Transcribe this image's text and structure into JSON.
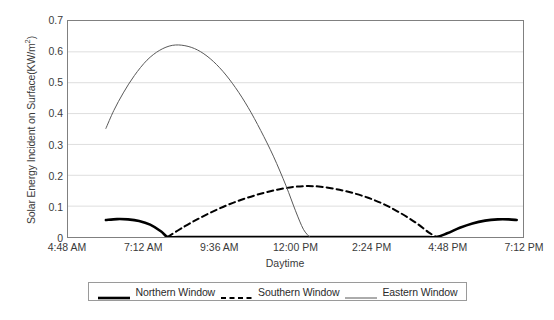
{
  "chart_data": {
    "type": "line",
    "title": "",
    "xlabel": "Daytime",
    "ylabel": "Solar Energy Incident on Surface(KW/m",
    "ylabel_sup": "2",
    "ylabel_suffix": ")",
    "xtick_labels": [
      "4:48 AM",
      "7:12 AM",
      "9:36 AM",
      "12:00 PM",
      "2:24 PM",
      "4:48 PM",
      "7:12 PM"
    ],
    "ytick_labels": [
      "0.7",
      "0.6",
      "0.5",
      "0.4",
      "0.3",
      "0.2",
      "0.1",
      "0"
    ],
    "ytick_values": [
      0.7,
      0.6,
      0.5,
      0.4,
      0.3,
      0.2,
      0.1,
      0
    ],
    "ylim": [
      0,
      0.7
    ],
    "xlim_hours": [
      4.8,
      19.2
    ],
    "grid": "horizontal",
    "legend_position": "bottom",
    "series": [
      {
        "name": "Northern Window",
        "style": "solid-thick",
        "color": "#000000",
        "width": 2.6,
        "x_hours": [
          6.0,
          6.35,
          6.7,
          7.05,
          7.4,
          7.75,
          7.95,
          8.3,
          9.0,
          10.0,
          11.0,
          12.0,
          13.0,
          14.0,
          15.0,
          16.0,
          16.45,
          16.8,
          17.2,
          17.6,
          18.0,
          18.4,
          18.75,
          19.0
        ],
        "y_values": [
          0.055,
          0.058,
          0.057,
          0.052,
          0.04,
          0.018,
          0.0,
          0.0,
          0.0,
          0.0,
          0.0,
          0.0,
          0.0,
          0.0,
          0.0,
          0.0,
          0.0,
          0.012,
          0.03,
          0.044,
          0.053,
          0.057,
          0.057,
          0.055
        ]
      },
      {
        "name": "Southern Window",
        "style": "dashed",
        "color": "#000000",
        "width": 2.0,
        "x_hours": [
          7.95,
          8.5,
          9.0,
          9.5,
          10.0,
          10.5,
          11.0,
          11.5,
          12.0,
          12.4,
          12.8,
          13.3,
          13.8,
          14.3,
          14.8,
          15.3,
          15.8,
          16.2,
          16.45
        ],
        "y_values": [
          0.0,
          0.035,
          0.063,
          0.088,
          0.11,
          0.128,
          0.143,
          0.155,
          0.163,
          0.165,
          0.163,
          0.155,
          0.143,
          0.127,
          0.106,
          0.079,
          0.047,
          0.016,
          0.0
        ]
      },
      {
        "name": "Eastern Window",
        "style": "solid-thin",
        "color": "#595959",
        "width": 1.0,
        "x_hours": [
          6.0,
          6.25,
          6.55,
          6.9,
          7.3,
          7.7,
          8.1,
          8.5,
          8.9,
          9.3,
          9.7,
          10.1,
          10.5,
          10.9,
          11.3,
          11.7,
          12.0,
          12.25,
          12.45
        ],
        "y_values": [
          0.352,
          0.41,
          0.467,
          0.523,
          0.573,
          0.605,
          0.621,
          0.62,
          0.606,
          0.578,
          0.537,
          0.484,
          0.42,
          0.345,
          0.262,
          0.166,
          0.085,
          0.025,
          0.0
        ]
      }
    ]
  },
  "legend": {
    "items": [
      {
        "label": "Northern Window",
        "swatch": "solid-thick"
      },
      {
        "label": "Southern Window",
        "swatch": "dashed"
      },
      {
        "label": "Eastern Window",
        "swatch": "solid-thin"
      }
    ]
  },
  "caption": {
    "text": ""
  }
}
